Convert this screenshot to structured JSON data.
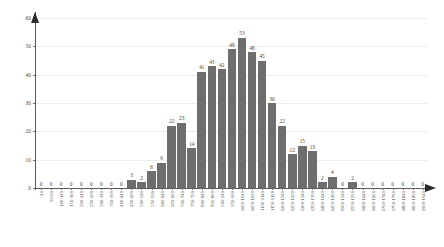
{
  "chart_data": {
    "type": "bar",
    "title": "",
    "subtitle": "",
    "xlabel": "",
    "ylabel": "",
    "ylim": [
      0,
      60
    ],
    "yticks": [
      0,
      10,
      20,
      30,
      40,
      50,
      60
    ],
    "grid": true,
    "legend": "none",
    "bar_color": "#6e6e6e",
    "axis_color": "#5a5a5a",
    "grid_color": "#ededed",
    "label_color": "#3a3a3a",
    "categories": [
      "-49",
      "50-99",
      "100-149",
      "150-199",
      "200-249",
      "250-299",
      "300-349",
      "350-399",
      "400-449",
      "450-499",
      "500-549",
      "550-599",
      "600-649",
      "650-699",
      "700-749",
      "750-799",
      "800-849",
      "850-899",
      "900-949",
      "950-999",
      "1000-1049",
      "1050-1099",
      "1100-1149",
      "1150-1199",
      "1200-1249",
      "1250-1299",
      "1300-1349",
      "1350-1399",
      "1400-1449",
      "1450-1499",
      "1500-1549",
      "1550-1599",
      "1600-1649",
      "1650-1699",
      "1700-1749",
      "1750-1799",
      "1800-1849",
      "1850-1899",
      "1900-1949"
    ],
    "values": [
      0,
      0,
      0,
      0,
      0,
      0,
      0,
      0,
      0,
      3,
      2,
      6,
      9,
      22,
      23,
      14,
      41,
      43,
      42,
      49,
      53,
      48,
      45,
      30,
      22,
      12,
      15,
      13,
      2,
      4,
      0,
      2,
      0,
      0,
      0,
      0,
      0,
      0,
      0
    ]
  }
}
